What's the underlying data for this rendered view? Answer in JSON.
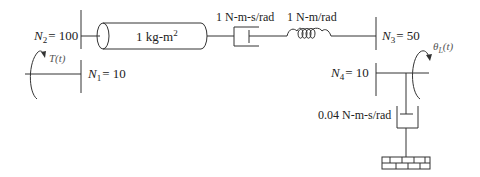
{
  "diagram": {
    "type": "rotational mechanical system with gear train",
    "gears": [
      {
        "id": "N1",
        "symbol": "N",
        "sub": "1",
        "value": "= 10"
      },
      {
        "id": "N2",
        "symbol": "N",
        "sub": "2",
        "value": "= 100"
      },
      {
        "id": "N3",
        "symbol": "N",
        "sub": "3",
        "value": "= 50"
      },
      {
        "id": "N4",
        "symbol": "N",
        "sub": "4",
        "value": "= 10"
      }
    ],
    "inertia": {
      "label": "1 kg-m",
      "sup": "2"
    },
    "damper_top": {
      "label": "1 N-m-s/rad"
    },
    "spring": {
      "label": "1 N-m/rad"
    },
    "damper_bottom": {
      "label": "0.04 N-m-s/rad"
    },
    "input_torque": {
      "label": "T(t)"
    },
    "output_angle": {
      "symbol": "θ",
      "sub": "L",
      "arg": "(t)"
    }
  }
}
